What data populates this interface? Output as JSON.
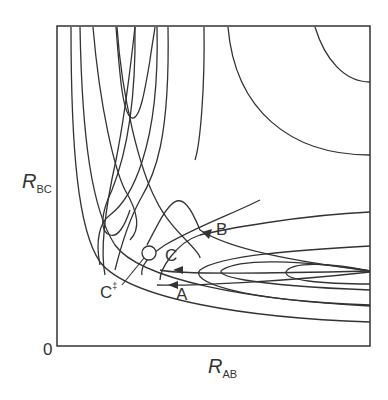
{
  "diagram": {
    "type": "potential-energy-surface-contour",
    "x_axis": {
      "label_main": "R",
      "label_sub": "AB"
    },
    "y_axis": {
      "label_main": "R",
      "label_sub": "BC"
    },
    "origin_label": "0",
    "points": {
      "A": "A",
      "B": "B",
      "C": "C",
      "C_ts": "C",
      "C_ts_mark": "‡"
    },
    "line_color": "#333333"
  }
}
